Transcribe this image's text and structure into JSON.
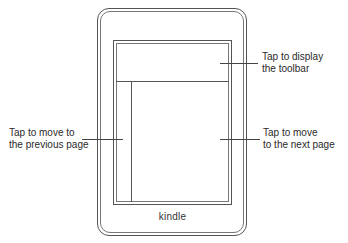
{
  "device": {
    "brand_label": "kindle"
  },
  "zones": {
    "toolbar": {
      "line1": "Tap to display",
      "line2": "the toolbar"
    },
    "next_page": {
      "line1": "Tap to move",
      "line2": "to the next page"
    },
    "previous_page": {
      "line1": "Tap to move to",
      "line2": "the previous page"
    }
  }
}
